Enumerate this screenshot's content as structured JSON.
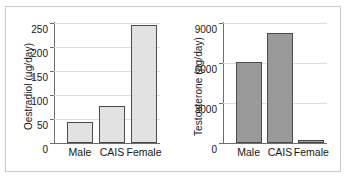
{
  "figure": {
    "frame_border_color": "#c9c9c9",
    "background": "#ffffff"
  },
  "chart_data": [
    {
      "type": "bar",
      "panel": "left",
      "title": "",
      "xlabel": "",
      "ylabel": "Oestradiol (µg/day)",
      "categories": [
        "Male",
        "CAIS",
        "Female"
      ],
      "values": [
        43,
        77,
        245
      ],
      "ylim": [
        0,
        250
      ],
      "yticks": [
        0,
        50,
        100,
        150,
        200,
        250
      ],
      "ytick_labels": [
        "0",
        "50",
        "100",
        "150",
        "200",
        "250"
      ],
      "grid": true,
      "legend": "none",
      "bar_fill": "#e2e2e2",
      "bar_edge": "#4a4a4a"
    },
    {
      "type": "bar",
      "panel": "right",
      "title": "",
      "xlabel": "",
      "ylabel": "Testosterone (µg/day)",
      "categories": [
        "Male",
        "CAIS",
        "Female"
      ],
      "values": [
        6050,
        8250,
        250
      ],
      "ylim": [
        0,
        9000
      ],
      "yticks": [
        0,
        3000,
        6000,
        9000
      ],
      "ytick_labels": [
        "0",
        "3000",
        "6000",
        "9000"
      ],
      "grid": true,
      "legend": "none",
      "bar_fill": "#9a9a9a",
      "bar_edge": "#4a4a4a"
    }
  ]
}
